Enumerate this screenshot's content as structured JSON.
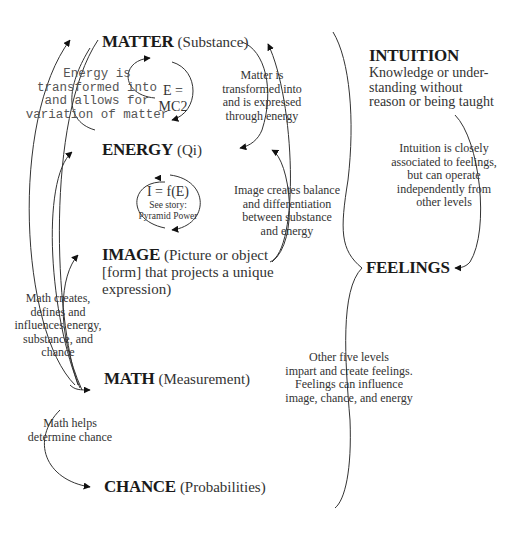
{
  "nodes": {
    "matter": {
      "title": "MATTER",
      "sub": "(Substance)"
    },
    "energy": {
      "title": "ENERGY",
      "sub": "(Qi)"
    },
    "image": {
      "title": "IMAGE",
      "sub_line1": "(Picture or object",
      "sub_line2": "[form] that projects a unique",
      "sub_line3": "expression)"
    },
    "math": {
      "title": "MATH",
      "sub": "(Measurement)"
    },
    "chance": {
      "title": "CHANCE",
      "sub": "(Probabilities)"
    },
    "intuition": {
      "title": "INTUITION",
      "desc_line1": "Knowledge or under-",
      "desc_line2": "standing without",
      "desc_line3": "reason or being taught"
    },
    "feelings": {
      "title": "FEELINGS"
    }
  },
  "formulas": {
    "emc2": "E = MC2",
    "ife": "I = f(E)",
    "ife_note1": "See story:",
    "ife_note2": "Pyramid Power"
  },
  "notes": {
    "energy_to_matter": [
      "Energy is",
      "transformed into",
      "and allows for",
      "variation of matter"
    ],
    "matter_to_energy": [
      "Matter is",
      "transformed into",
      "and is expressed",
      "through energy"
    ],
    "image_balance": [
      "Image creates balance",
      "and differentiation",
      "between substance",
      "and energy"
    ],
    "intuition_feelings": [
      "Intuition is closely",
      "associated to feelings,",
      "but can operate",
      "independently from",
      "other levels"
    ],
    "math_creates": [
      "Math creates,",
      "defines and",
      "influences energy,",
      "substance, and",
      "chance"
    ],
    "math_helps": [
      "Math helps",
      "determine chance"
    ],
    "other_levels": [
      "Other five levels",
      "impart and create feelings.",
      "Feelings can influence",
      "image, chance, and energy"
    ]
  }
}
